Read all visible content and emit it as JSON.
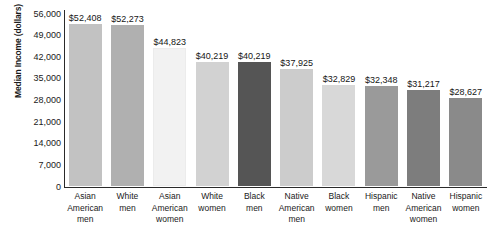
{
  "chart_data": {
    "type": "bar",
    "title": "",
    "subtitle": "",
    "xlabel": "",
    "ylabel": "Median Income (dollars)",
    "ylim": [
      0,
      56000
    ],
    "grid": false,
    "legend": "none",
    "orientation": "vertical",
    "y_ticks": [
      "0",
      "7,000",
      "14,000",
      "21,000",
      "28,000",
      "35,000",
      "42,000",
      "49,000",
      "56,000"
    ],
    "y_tick_values": [
      0,
      7000,
      14000,
      21000,
      28000,
      35000,
      42000,
      49000,
      56000
    ],
    "categories": [
      "Asian American men",
      "White men",
      "Asian American women",
      "White women",
      "Black men",
      "Native American men",
      "Black women",
      "Hispanic men",
      "Native American women",
      "Hispanic women"
    ],
    "category_lines": [
      [
        "Asian",
        "American",
        "men"
      ],
      [
        "White",
        "men"
      ],
      [
        "Asian",
        "American",
        "women"
      ],
      [
        "White",
        "women"
      ],
      [
        "Black",
        "men"
      ],
      [
        "Native",
        "American",
        "men"
      ],
      [
        "Black",
        "women"
      ],
      [
        "Hispanic",
        "men"
      ],
      [
        "Native",
        "American",
        "women"
      ],
      [
        "Hispanic",
        "women"
      ]
    ],
    "values": [
      52408,
      52273,
      44823,
      40219,
      40219,
      37925,
      32829,
      32348,
      31217,
      28627
    ],
    "value_labels": [
      "$52,408",
      "$52,273",
      "$44,823",
      "$40,219",
      "$40,219",
      "$37,925",
      "$32,829",
      "$32,348",
      "$31,217",
      "$28,627"
    ],
    "bar_colors": [
      "#c2c2c2",
      "#b0b0b0",
      "#f2f2f2",
      "#d2d2d2",
      "#555555",
      "#cccccc",
      "#d8d8d8",
      "#9a9a9a",
      "#7d7d7d",
      "#8a8a8a"
    ]
  }
}
